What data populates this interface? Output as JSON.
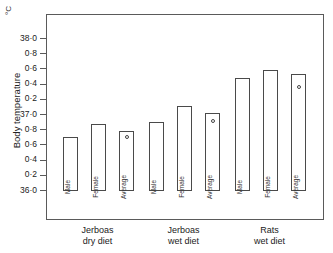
{
  "figure": {
    "unit_label": "°C",
    "y_axis_title": "Body temperature",
    "caption": ""
  },
  "chart_data": {
    "type": "bar",
    "title": "",
    "subtitle": "",
    "xlabel": "",
    "ylabel": "Body temperature",
    "unit": "°C",
    "ylim": [
      36.0,
      38.0
    ],
    "grid": false,
    "legend": "none",
    "y_ticks": [
      36.0,
      36.2,
      36.4,
      36.6,
      36.8,
      37.0,
      37.2,
      37.4,
      37.6,
      37.8,
      38.0
    ],
    "y_tick_labels": [
      "36·0",
      "0·2",
      "0·4",
      "0·6",
      "0·8",
      "37·0",
      "0·2",
      "0·4",
      "0·6",
      "0·8",
      "38·0"
    ],
    "groups": [
      {
        "label_line1": "Jerboas",
        "label_line2": "dry  diet",
        "categories": [
          "Male",
          "Female",
          "Average"
        ],
        "values": [
          36.71,
          36.88,
          36.79
        ],
        "marker_values": [
          null,
          null,
          36.72
        ]
      },
      {
        "label_line1": "Jerboas",
        "label_line2": "wet diet",
        "categories": [
          "Male",
          "Female",
          "Average"
        ],
        "values": [
          36.91,
          37.12,
          37.03
        ],
        "marker_values": [
          null,
          null,
          36.94
        ]
      },
      {
        "label_line1": "Rats",
        "label_line2": "wet diet",
        "categories": [
          "Male",
          "Female",
          "Average"
        ],
        "values": [
          37.49,
          37.59,
          37.54
        ],
        "marker_values": [
          null,
          null,
          37.38
        ]
      }
    ]
  },
  "style": {
    "axis_color": "#5a5a5a",
    "bar_edge_color": "#4a4a4a",
    "bar_fill_color": "#ffffff",
    "text_color": "#222222",
    "background": "#ffffff"
  }
}
